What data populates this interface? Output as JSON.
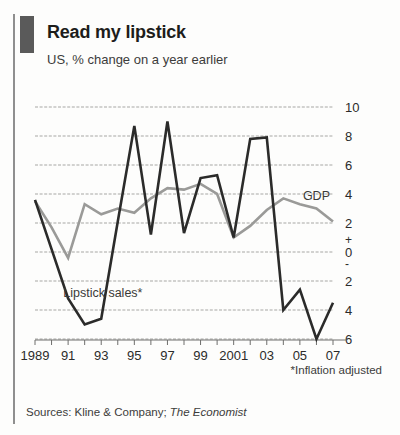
{
  "header": {
    "title": "Read my lipstick",
    "subtitle": "US, % change on a year earlier",
    "accent_block_color": "#5a5a5a"
  },
  "footer": {
    "footnote": "*Inflation adjusted",
    "sources_prefix": "Sources: Kline & Company; ",
    "sources_italic": "The Economist"
  },
  "chart_data": {
    "type": "line",
    "title": "Read my lipstick",
    "subtitle": "US, % change on a year earlier",
    "xlabel": "",
    "ylabel": "% change on a year earlier",
    "ylim": [
      -6,
      10
    ],
    "xlim": [
      1989,
      2007
    ],
    "grid": true,
    "gridlines": [
      10,
      8,
      6,
      4,
      2,
      0,
      -2,
      -4,
      -6
    ],
    "ytick_labels": [
      "10",
      "8",
      "6",
      "4",
      "2",
      "0",
      "2",
      "4",
      "6"
    ],
    "ytick_values": [
      10,
      8,
      6,
      4,
      2,
      0,
      -2,
      -4,
      -6
    ],
    "sign_plus": "+",
    "sign_minus": "-",
    "x": [
      1989,
      1990,
      1991,
      1992,
      1993,
      1994,
      1995,
      1996,
      1997,
      1998,
      1999,
      2000,
      2001,
      2002,
      2003,
      2004,
      2005,
      2006,
      2007
    ],
    "xtick_labels": [
      "1989",
      "",
      "91",
      "",
      "93",
      "",
      "95",
      "",
      "97",
      "",
      "99",
      "",
      "2001",
      "",
      "03",
      "",
      "05",
      "",
      "07"
    ],
    "legend_position": "inline",
    "series": [
      {
        "name": "Lipstick sales*",
        "color": "#2b2b2a",
        "width": 2.6,
        "label_x": 1993.1,
        "label_y": -3.1,
        "values": [
          3.6,
          0.2,
          -3.2,
          -5.0,
          -4.6,
          2.1,
          8.7,
          1.2,
          9.0,
          1.3,
          5.1,
          5.3,
          1.0,
          7.8,
          7.9,
          -4.0,
          -2.6,
          -6.0,
          -3.5
        ]
      },
      {
        "name": "GDP",
        "color": "#9a9a98",
        "width": 2.6,
        "label_x": 2006.0,
        "label_y": 3.6,
        "values": [
          3.5,
          1.7,
          -0.4,
          3.3,
          2.6,
          3.0,
          2.7,
          3.7,
          4.4,
          4.3,
          4.7,
          4.0,
          1.0,
          1.8,
          2.9,
          3.7,
          3.3,
          3.0,
          2.1
        ]
      }
    ],
    "plot_geometry": {
      "left": 35,
      "right": 333,
      "top": 107,
      "bottom": 339
    }
  }
}
